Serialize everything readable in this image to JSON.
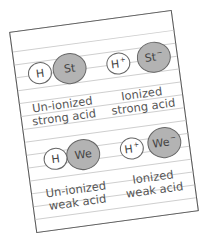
{
  "diagram": {
    "title": "",
    "colors": {
      "paper": "#ffffff",
      "rule_lines": "#cfcfcf",
      "paper_border": "#555555",
      "anion_fill": "#b3b3b3",
      "proton_fill": "#ffffff",
      "text": "#555555"
    },
    "panels": [
      {
        "id": "unionized-strong",
        "hydrogen": {
          "symbol": "H",
          "charge": ""
        },
        "anion": {
          "symbol": "St",
          "charge": ""
        },
        "bonded": true,
        "label_line1": "Un-ionized",
        "label_line2": "strong acid"
      },
      {
        "id": "ionized-strong",
        "hydrogen": {
          "symbol": "H",
          "charge": "+"
        },
        "anion": {
          "symbol": "St",
          "charge": "−"
        },
        "bonded": false,
        "label_line1": "Ionized",
        "label_line2": "strong acid"
      },
      {
        "id": "unionized-weak",
        "hydrogen": {
          "symbol": "H",
          "charge": ""
        },
        "anion": {
          "symbol": "We",
          "charge": ""
        },
        "bonded": true,
        "label_line1": "Un-ionized",
        "label_line2": "weak acid"
      },
      {
        "id": "ionized-weak",
        "hydrogen": {
          "symbol": "H",
          "charge": "+"
        },
        "anion": {
          "symbol": "We",
          "charge": "−"
        },
        "bonded": false,
        "label_line1": "Ionized",
        "label_line2": "weak acid"
      }
    ]
  }
}
